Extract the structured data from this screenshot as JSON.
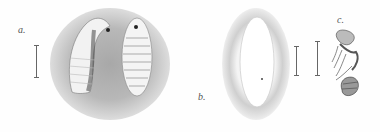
{
  "figure": {
    "labels": {
      "a": "a.",
      "b": "b.",
      "c": "c."
    },
    "panels": [
      {
        "id": "a",
        "description": "two larvae, side and ventral views, on stippled shaded background"
      },
      {
        "id": "b",
        "description": "elongate oval egg with stippled shading"
      },
      {
        "id": "c",
        "description": "pupa / adult insect lateral view"
      }
    ],
    "colors": {
      "background": "#fefefe",
      "stipple": "#9a9a9a",
      "ink": "#333333"
    }
  }
}
